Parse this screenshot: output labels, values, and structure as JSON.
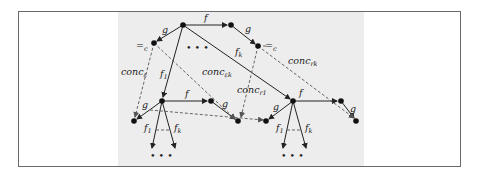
{
  "figure": {
    "type": "term-graph diagram",
    "background_panel_color": "#ededed",
    "edge_color": "#222222",
    "dashed_edge_color": "#555555"
  },
  "nodes": [
    {
      "id": "root",
      "x": 183,
      "y": 25
    },
    {
      "id": "top_right",
      "x": 231,
      "y": 25
    },
    {
      "id": "top_left_eq",
      "x": 154,
      "y": 43
    },
    {
      "id": "top_right_eq",
      "x": 258,
      "y": 46
    },
    {
      "id": "mid_left",
      "x": 162,
      "y": 101
    },
    {
      "id": "mid_left_f",
      "x": 211,
      "y": 101
    },
    {
      "id": "bottom_left_g",
      "x": 134,
      "y": 121
    },
    {
      "id": "bottom_mid_g",
      "x": 238,
      "y": 121
    },
    {
      "id": "mid_right",
      "x": 293,
      "y": 101
    },
    {
      "id": "mid_right_f",
      "x": 341,
      "y": 101
    },
    {
      "id": "bottom_right_g1",
      "x": 266,
      "y": 121
    },
    {
      "id": "bottom_right_g2",
      "x": 356,
      "y": 121
    }
  ],
  "labels": {
    "f_top": "f",
    "g_top_left": "g",
    "g_top_right": "g",
    "eq_left": "=",
    "eq_left_sub": "c",
    "eq_right": "=",
    "eq_right_sub": "c",
    "dots_top": "• • •",
    "fk_top": "f",
    "fk_top_sub": "k",
    "f1_top": "f",
    "f1_top_sub": "1",
    "conc_left": "conc",
    "conc_left_sub": "ε",
    "conc_mid": "conc",
    "conc_mid_sub": "εk",
    "conc_r1": "conc",
    "conc_r1_sub": "r1",
    "conc_rk": "conc",
    "conc_rk_sub": "rk",
    "f_mid_left": "f",
    "g_mid_left_a": "g",
    "g_mid_left_b": "g",
    "f1_bottom_left": "f",
    "f1_bottom_left_sub": "1",
    "fk_bottom_left": "f",
    "fk_bottom_left_sub": "k",
    "dots_bottom_left": "• • •",
    "f_mid_right": "f",
    "g_mid_right_a": "g",
    "g_mid_right_b": "g",
    "f1_bottom_right": "f",
    "f1_bottom_right_sub": "1",
    "fk_bottom_right": "f",
    "fk_bottom_right_sub": "k",
    "dots_bottom_right": "• • •"
  }
}
